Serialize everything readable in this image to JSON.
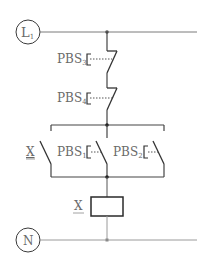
{
  "diagram": {
    "colors": {
      "wire": "#7a7a7a",
      "component": "#2a2a2a",
      "label": "#6a6a6a",
      "background": "#ffffff"
    },
    "rails": {
      "line": {
        "label": "L",
        "subscript": "1"
      },
      "neutral": {
        "label": "N",
        "subscript": ""
      }
    },
    "components": {
      "pbs3": {
        "label": "PBS",
        "subscript": "3",
        "type": "normally-closed pushbutton"
      },
      "pbs4": {
        "label": "PBS",
        "subscript": "4",
        "type": "normally-closed pushbutton"
      },
      "x_contact": {
        "label": "X",
        "type": "normally-open holding contact"
      },
      "pbs1": {
        "label": "PBS",
        "subscript": "1",
        "type": "normally-open pushbutton"
      },
      "pbs2": {
        "label": "PBS",
        "subscript": "2",
        "type": "normally-open pushbutton"
      },
      "x_coil": {
        "label": "X",
        "type": "relay coil"
      }
    }
  }
}
